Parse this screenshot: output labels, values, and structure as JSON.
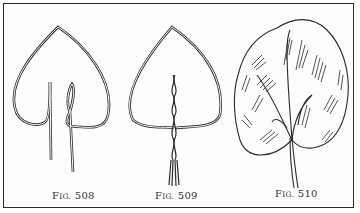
{
  "figures": [
    {
      "id": "fig-508",
      "caption_prefix": "F",
      "caption_prefix_sc": "IG.",
      "caption_number": "508",
      "description": "Wire bent into heart-shaped leaf outline, ends hooked and looped at center"
    },
    {
      "id": "fig-509",
      "caption_prefix": "F",
      "caption_prefix_sc": "IG.",
      "caption_number": "509",
      "description": "Heart-shaped wire outline with ends twisted together into a stem"
    },
    {
      "id": "fig-510",
      "caption_prefix": "F",
      "caption_prefix_sc": "IG.",
      "caption_number": "510",
      "description": "Finished shaded leaf with veins and stem"
    }
  ],
  "colors": {
    "ink": "#2a2a2a",
    "paper": "#fdfdfb"
  }
}
